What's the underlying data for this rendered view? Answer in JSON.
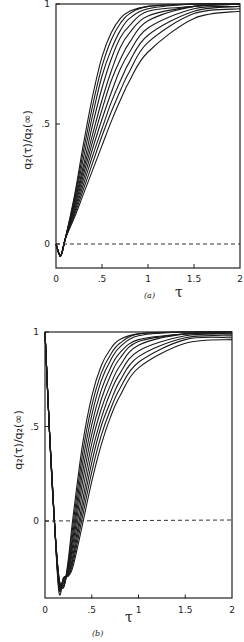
{
  "chart_data": [
    {
      "panel": "(a)",
      "type": "line",
      "caption": "(a)",
      "xlabel": "τ",
      "ylabel": "q₂(τ)/q₂(∞)",
      "xlim": [
        0,
        2
      ],
      "ylim": [
        -0.1,
        1
      ],
      "xticks": [
        "0",
        ".5",
        "1",
        "1.5",
        "2"
      ],
      "yticks": [
        "0",
        ".5",
        "1"
      ],
      "grid": false,
      "legend": null,
      "reference_line": {
        "y": 0,
        "style": "dashed"
      },
      "series_count": 10,
      "description": "Family of 10 sigmoidal curves starting near 0 at τ=0, dipping slightly below 0 (min ≈ -0.05 near τ≈0.05), crossing 0 near τ≈0.1, then rising monotonically toward 1; steeper curves saturate by τ≈1, slowest reaches ≈0.97 at τ=2.",
      "series": [
        {
          "name": "curve 1",
          "x": [
            0,
            0.05,
            0.1,
            0.2,
            0.3,
            0.4,
            0.5,
            0.6,
            0.7,
            0.8,
            1.0,
            1.5,
            2.0
          ],
          "y": [
            0,
            -0.05,
            0.02,
            0.2,
            0.42,
            0.62,
            0.78,
            0.88,
            0.94,
            0.97,
            0.99,
            1.0,
            1.0
          ]
        },
        {
          "name": "curve 2",
          "x": [
            0,
            0.05,
            0.1,
            0.2,
            0.3,
            0.4,
            0.5,
            0.6,
            0.7,
            0.8,
            1.0,
            1.5,
            2.0
          ],
          "y": [
            0,
            -0.05,
            0.02,
            0.19,
            0.39,
            0.58,
            0.74,
            0.85,
            0.92,
            0.96,
            0.99,
            1.0,
            1.0
          ]
        },
        {
          "name": "curve 3",
          "x": [
            0,
            0.05,
            0.1,
            0.2,
            0.3,
            0.4,
            0.5,
            0.6,
            0.7,
            0.8,
            1.0,
            1.5,
            2.0
          ],
          "y": [
            0,
            -0.05,
            0.02,
            0.18,
            0.36,
            0.54,
            0.7,
            0.81,
            0.89,
            0.94,
            0.98,
            1.0,
            1.0
          ]
        },
        {
          "name": "curve 4",
          "x": [
            0,
            0.05,
            0.1,
            0.2,
            0.3,
            0.4,
            0.5,
            0.6,
            0.7,
            0.8,
            1.0,
            1.5,
            2.0
          ],
          "y": [
            0,
            -0.05,
            0.02,
            0.17,
            0.33,
            0.5,
            0.65,
            0.77,
            0.86,
            0.91,
            0.97,
            0.99,
            1.0
          ]
        },
        {
          "name": "curve 5",
          "x": [
            0,
            0.05,
            0.1,
            0.2,
            0.3,
            0.4,
            0.5,
            0.6,
            0.7,
            0.8,
            1.0,
            1.5,
            2.0
          ],
          "y": [
            0,
            -0.05,
            0.02,
            0.16,
            0.31,
            0.46,
            0.6,
            0.72,
            0.82,
            0.88,
            0.95,
            0.99,
            1.0
          ]
        },
        {
          "name": "curve 6",
          "x": [
            0,
            0.05,
            0.1,
            0.2,
            0.3,
            0.4,
            0.5,
            0.6,
            0.7,
            0.8,
            1.0,
            1.5,
            2.0
          ],
          "y": [
            0,
            -0.05,
            0.02,
            0.15,
            0.29,
            0.43,
            0.56,
            0.68,
            0.77,
            0.84,
            0.93,
            0.99,
            1.0
          ]
        },
        {
          "name": "curve 7",
          "x": [
            0,
            0.05,
            0.1,
            0.2,
            0.3,
            0.4,
            0.5,
            0.6,
            0.7,
            0.8,
            1.0,
            1.5,
            2.0
          ],
          "y": [
            0,
            -0.05,
            0.02,
            0.14,
            0.27,
            0.4,
            0.52,
            0.63,
            0.73,
            0.8,
            0.9,
            0.98,
            0.99
          ]
        },
        {
          "name": "curve 8",
          "x": [
            0,
            0.05,
            0.1,
            0.2,
            0.3,
            0.4,
            0.5,
            0.6,
            0.7,
            0.8,
            1.0,
            1.5,
            2.0
          ],
          "y": [
            0,
            -0.05,
            0.02,
            0.13,
            0.25,
            0.37,
            0.48,
            0.59,
            0.68,
            0.76,
            0.87,
            0.97,
            0.99
          ]
        },
        {
          "name": "curve 9",
          "x": [
            0,
            0.05,
            0.1,
            0.2,
            0.3,
            0.4,
            0.5,
            0.6,
            0.7,
            0.8,
            1.0,
            1.5,
            2.0
          ],
          "y": [
            0,
            -0.05,
            0.02,
            0.12,
            0.23,
            0.34,
            0.45,
            0.55,
            0.64,
            0.72,
            0.84,
            0.96,
            0.98
          ]
        },
        {
          "name": "curve 10",
          "x": [
            0,
            0.05,
            0.1,
            0.2,
            0.3,
            0.4,
            0.5,
            0.6,
            0.7,
            0.8,
            1.0,
            1.5,
            2.0
          ],
          "y": [
            0,
            -0.05,
            0.02,
            0.11,
            0.21,
            0.31,
            0.41,
            0.51,
            0.6,
            0.68,
            0.8,
            0.94,
            0.97
          ]
        }
      ]
    },
    {
      "panel": "(b)",
      "type": "line",
      "caption": "(b)",
      "xlabel": "τ",
      "ylabel": "q₂(τ)/q₂(∞)",
      "xlim": [
        0,
        2
      ],
      "ylim": [
        -0.41,
        1
      ],
      "xticks": [
        "0",
        ".5",
        "1",
        "1.5",
        "2"
      ],
      "yticks": [
        "0",
        ".5",
        "1"
      ],
      "grid": false,
      "legend": null,
      "reference_line": {
        "y": 0,
        "style": "dashed"
      },
      "series_count": 10,
      "description": "Family of 10 curves starting at 1 at τ=0, plunging to a minimum of about -0.3 to -0.38 near τ≈0.15–0.25, crossing 0 between τ≈0.3 and τ≈0.5, then rising toward 1; fastest curves saturate by τ≈1.2, slowest reaches ≈0.95 at τ=2.",
      "series": [
        {
          "name": "curve 1",
          "x": [
            0,
            0.05,
            0.1,
            0.15,
            0.2,
            0.25,
            0.3,
            0.4,
            0.5,
            0.6,
            0.7,
            0.8,
            1.0,
            1.5,
            2.0
          ],
          "y": [
            1.0,
            0.45,
            0.0,
            -0.3,
            -0.35,
            -0.2,
            0.02,
            0.4,
            0.66,
            0.82,
            0.91,
            0.96,
            0.99,
            1.0,
            1.0
          ]
        },
        {
          "name": "curve 2",
          "x": [
            0,
            0.05,
            0.1,
            0.15,
            0.2,
            0.25,
            0.3,
            0.4,
            0.5,
            0.6,
            0.7,
            0.8,
            1.0,
            1.5,
            2.0
          ],
          "y": [
            1.0,
            0.45,
            0.0,
            -0.3,
            -0.35,
            -0.22,
            -0.02,
            0.35,
            0.61,
            0.78,
            0.88,
            0.94,
            0.99,
            1.0,
            1.0
          ]
        },
        {
          "name": "curve 3",
          "x": [
            0,
            0.05,
            0.1,
            0.15,
            0.2,
            0.25,
            0.3,
            0.4,
            0.5,
            0.6,
            0.7,
            0.8,
            1.0,
            1.5,
            2.0
          ],
          "y": [
            1.0,
            0.45,
            0.0,
            -0.31,
            -0.34,
            -0.24,
            -0.06,
            0.3,
            0.56,
            0.74,
            0.85,
            0.92,
            0.98,
            1.0,
            1.0
          ]
        },
        {
          "name": "curve 4",
          "x": [
            0,
            0.05,
            0.1,
            0.15,
            0.2,
            0.25,
            0.3,
            0.4,
            0.5,
            0.6,
            0.7,
            0.8,
            1.0,
            1.5,
            2.0
          ],
          "y": [
            1.0,
            0.45,
            0.0,
            -0.31,
            -0.33,
            -0.25,
            -0.09,
            0.25,
            0.51,
            0.69,
            0.81,
            0.89,
            0.96,
            0.99,
            1.0
          ]
        },
        {
          "name": "curve 5",
          "x": [
            0,
            0.05,
            0.1,
            0.15,
            0.2,
            0.25,
            0.3,
            0.4,
            0.5,
            0.6,
            0.7,
            0.8,
            1.0,
            1.5,
            2.0
          ],
          "y": [
            1.0,
            0.45,
            0.0,
            -0.32,
            -0.32,
            -0.26,
            -0.12,
            0.2,
            0.46,
            0.64,
            0.77,
            0.86,
            0.95,
            0.99,
            1.0
          ]
        },
        {
          "name": "curve 6",
          "x": [
            0,
            0.05,
            0.1,
            0.15,
            0.2,
            0.25,
            0.3,
            0.4,
            0.5,
            0.6,
            0.7,
            0.8,
            1.0,
            1.5,
            2.0
          ],
          "y": [
            1.0,
            0.45,
            0.0,
            -0.33,
            -0.31,
            -0.27,
            -0.15,
            0.15,
            0.41,
            0.59,
            0.72,
            0.82,
            0.93,
            0.99,
            0.99
          ]
        },
        {
          "name": "curve 7",
          "x": [
            0,
            0.05,
            0.1,
            0.15,
            0.2,
            0.25,
            0.3,
            0.4,
            0.5,
            0.6,
            0.7,
            0.8,
            1.0,
            1.5,
            2.0
          ],
          "y": [
            1.0,
            0.45,
            0.0,
            -0.34,
            -0.3,
            -0.28,
            -0.18,
            0.1,
            0.36,
            0.54,
            0.68,
            0.78,
            0.9,
            0.98,
            0.99
          ]
        },
        {
          "name": "curve 8",
          "x": [
            0,
            0.05,
            0.1,
            0.15,
            0.2,
            0.25,
            0.3,
            0.4,
            0.5,
            0.6,
            0.7,
            0.8,
            1.0,
            1.5,
            2.0
          ],
          "y": [
            1.0,
            0.45,
            0.0,
            -0.35,
            -0.3,
            -0.28,
            -0.2,
            0.06,
            0.31,
            0.5,
            0.63,
            0.74,
            0.87,
            0.97,
            0.98
          ]
        },
        {
          "name": "curve 9",
          "x": [
            0,
            0.05,
            0.1,
            0.15,
            0.2,
            0.25,
            0.3,
            0.4,
            0.5,
            0.6,
            0.7,
            0.8,
            1.0,
            1.5,
            2.0
          ],
          "y": [
            1.0,
            0.45,
            0.0,
            -0.36,
            -0.3,
            -0.29,
            -0.22,
            0.02,
            0.26,
            0.45,
            0.59,
            0.7,
            0.84,
            0.96,
            0.97
          ]
        },
        {
          "name": "curve 10",
          "x": [
            0,
            0.05,
            0.1,
            0.15,
            0.2,
            0.25,
            0.3,
            0.4,
            0.5,
            0.6,
            0.7,
            0.8,
            1.0,
            1.5,
            2.0
          ],
          "y": [
            1.0,
            0.45,
            0.0,
            -0.38,
            -0.3,
            -0.29,
            -0.24,
            -0.02,
            0.21,
            0.4,
            0.55,
            0.66,
            0.81,
            0.94,
            0.96
          ]
        }
      ]
    }
  ],
  "labels": {
    "a": {
      "caption": "(a)",
      "xlabel": "τ",
      "ylabel_main": "q",
      "ylabel_full": "q₂(τ)/q₂(∞)",
      "xticks": [
        "0",
        ".5",
        "1",
        "1.5",
        "2"
      ],
      "yticks": [
        "0",
        ".5",
        "1"
      ]
    },
    "b": {
      "caption": "(b)",
      "xlabel": "τ",
      "ylabel_full": "q₂(τ)/q₂(∞)",
      "xticks": [
        "0",
        ".5",
        "1",
        "1.5",
        "2"
      ],
      "yticks": [
        "0",
        ".5",
        "1"
      ]
    }
  },
  "colors": {
    "line": "#1a1a1a",
    "axis": "#222222",
    "background": "#ffffff"
  }
}
